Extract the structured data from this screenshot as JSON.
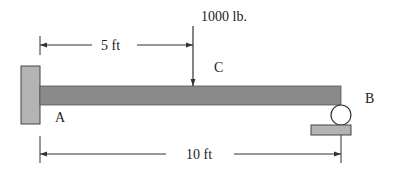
{
  "diagram": {
    "type": "beam-statics",
    "load": {
      "label": "1000 lb.",
      "point_label": "C"
    },
    "supports": {
      "left": {
        "type": "fixed-wall",
        "label": "A"
      },
      "right": {
        "type": "roller",
        "label": "B"
      }
    },
    "dimensions": {
      "top": {
        "label": "5 ft"
      },
      "bottom": {
        "label": "10 ft"
      }
    },
    "colors": {
      "beam": "#8a8a8a",
      "wall": "#b4b4b4",
      "plate": "#b4b4b4",
      "line": "#333333"
    }
  }
}
